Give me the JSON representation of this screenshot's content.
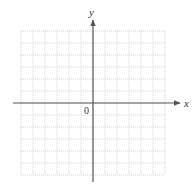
{
  "diagram": {
    "type": "coordinate-grid",
    "x_axis_label": "x",
    "y_axis_label": "y",
    "origin_label": "0",
    "grid": {
      "columns": 12,
      "rows": 12,
      "cells_left_of_y_axis": 6,
      "cells_right_of_y_axis": 6,
      "cells_above_x_axis": 6,
      "cells_below_x_axis": 6,
      "line_style": "dotted",
      "line_color": "#c8c8c8"
    },
    "axis_color": "#555555"
  }
}
